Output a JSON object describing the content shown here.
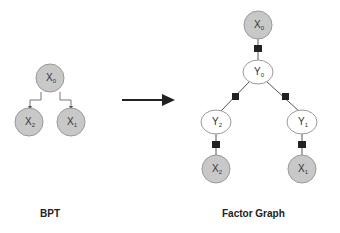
{
  "colors": {
    "observed_fill": "#c8c8c8",
    "latent_fill": "#ffffff",
    "stroke": "#888888",
    "edge": "#555555",
    "factor": "#222222"
  },
  "bpt": {
    "caption": "BPT",
    "nodes": [
      {
        "id": "x0",
        "base": "X",
        "sub": "0"
      },
      {
        "id": "x2",
        "base": "X",
        "sub": "2"
      },
      {
        "id": "x1",
        "base": "X",
        "sub": "1"
      }
    ]
  },
  "factor_graph": {
    "caption": "Factor Graph",
    "nodes": [
      {
        "id": "X0",
        "base": "X",
        "sub": "0"
      },
      {
        "id": "Y0",
        "base": "Y",
        "sub": "0"
      },
      {
        "id": "Y2",
        "base": "Y",
        "sub": "2"
      },
      {
        "id": "Y1",
        "base": "Y",
        "sub": "1"
      },
      {
        "id": "X2",
        "base": "X",
        "sub": "2"
      },
      {
        "id": "X1",
        "base": "X",
        "sub": "1"
      }
    ]
  }
}
